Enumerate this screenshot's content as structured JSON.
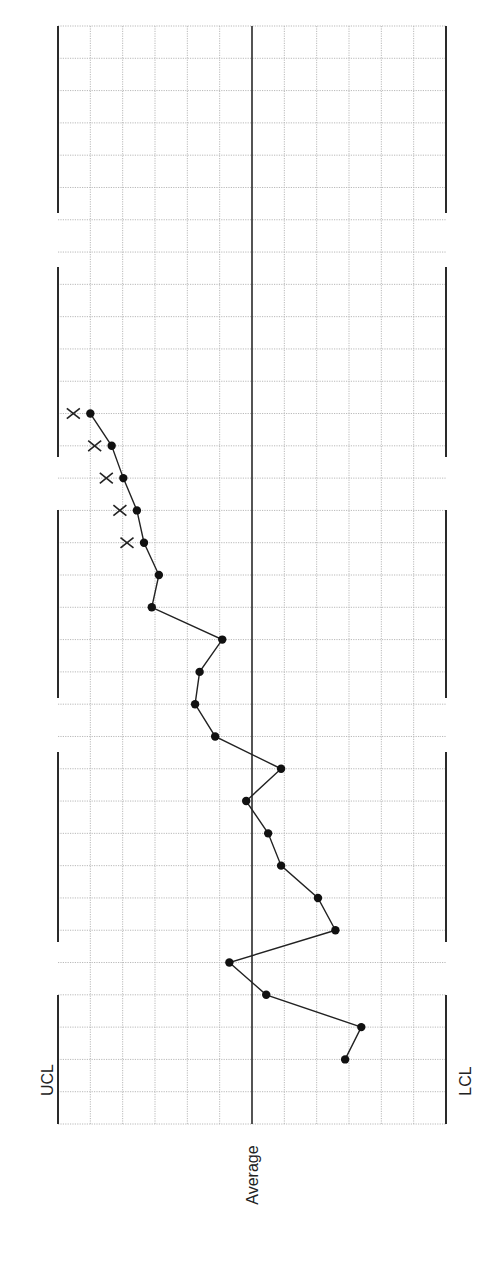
{
  "chart_data": {
    "type": "line",
    "title": "",
    "orientation": "rotated-90",
    "xlabel": "",
    "ylabel": "",
    "control_limits": {
      "ucl_label": "UCL",
      "center_label": "Average",
      "lcl_label": "LCL",
      "ucl": 3,
      "center": 0,
      "lcl": -3
    },
    "ylim": [
      -3,
      3
    ],
    "grid": true,
    "x": [
      1,
      2,
      3,
      4,
      5,
      6,
      7,
      8,
      9,
      10,
      11,
      12,
      13,
      14,
      15,
      16,
      17,
      18,
      19,
      20,
      21
    ],
    "series": [
      {
        "name": "Process measurements",
        "values": [
          -1.44,
          -1.69,
          -0.22,
          0.35,
          -1.29,
          -1.02,
          -0.45,
          -0.25,
          0.09,
          -0.45,
          0.57,
          0.88,
          0.81,
          0.46,
          1.55,
          1.44,
          1.67,
          1.78,
          1.99,
          2.17,
          2.5
        ]
      }
    ],
    "annotations": [
      {
        "type": "x-mark",
        "x": 17,
        "label": "X"
      },
      {
        "type": "x-mark",
        "x": 18,
        "label": "X"
      },
      {
        "type": "x-mark",
        "x": 19,
        "label": "X"
      },
      {
        "type": "x-mark",
        "x": 20,
        "label": "X"
      },
      {
        "type": "x-mark",
        "x": 21,
        "label": "X"
      }
    ]
  },
  "labels": {
    "ucl": "UCL",
    "average": "Average",
    "lcl": "LCL"
  },
  "layout": {
    "grid_left": 58,
    "grid_right": 446,
    "grid_top": 26,
    "grid_bottom": 1124,
    "cols": 12,
    "rows": 34,
    "first_point_row": 32,
    "limit_gaps": [
      [
        213,
        267
      ],
      [
        457,
        510
      ],
      [
        698,
        752
      ],
      [
        942,
        995
      ]
    ]
  }
}
